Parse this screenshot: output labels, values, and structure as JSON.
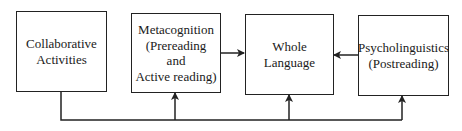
{
  "diagram": {
    "nodes": [
      {
        "id": "collaborative",
        "lines": [
          "Collaborative",
          "Activities"
        ]
      },
      {
        "id": "metacognition",
        "lines": [
          "Metacognition",
          "(Prereading",
          "and",
          "Active reading)"
        ]
      },
      {
        "id": "whole-language",
        "lines": [
          "Whole",
          "Language"
        ]
      },
      {
        "id": "psycholinguistics",
        "lines": [
          "Psycholinguistics",
          "(Postreading)"
        ]
      }
    ],
    "edges": [
      {
        "from": "metacognition",
        "to": "whole-language"
      },
      {
        "from": "psycholinguistics",
        "to": "whole-language"
      },
      {
        "from": "collaborative",
        "to": "metacognition"
      },
      {
        "from": "collaborative",
        "to": "whole-language"
      },
      {
        "from": "collaborative",
        "to": "psycholinguistics"
      }
    ],
    "colors": {
      "stroke": "#222222",
      "background": "#ffffff"
    }
  }
}
